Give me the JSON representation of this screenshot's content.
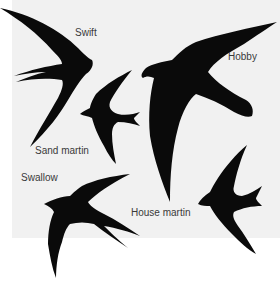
{
  "figure": {
    "background": "#f1f1f1",
    "silhouette_color": "#0a0a0a",
    "labels": {
      "swift": "Swift",
      "hobby": "Hobby",
      "sand_martin": "Sand martin",
      "swallow": "Swallow",
      "house_martin": "House martin"
    }
  }
}
